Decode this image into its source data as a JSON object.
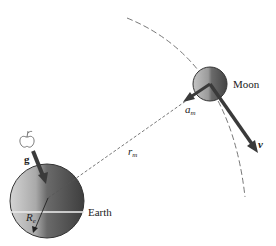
{
  "diagram": {
    "bodies": {
      "earth": {
        "label": "Earth",
        "radius_label": "R",
        "radius_sub": "e"
      },
      "moon": {
        "label": "Moon"
      }
    },
    "vectors": {
      "g": {
        "label": "g"
      },
      "a_m": {
        "label": "a",
        "sub": "m"
      },
      "v": {
        "label": "v"
      }
    },
    "distance": {
      "label": "r",
      "sub": "m"
    },
    "apple": {
      "label": "apple"
    },
    "colors": {
      "line": "#555555",
      "arrow": "#3a3a3a",
      "earth_light": "#c8c8c8",
      "earth_dark": "#4a4a4a",
      "moon_light": "#b0b0b0",
      "moon_dark": "#4e4e4e",
      "text": "#222222"
    }
  }
}
